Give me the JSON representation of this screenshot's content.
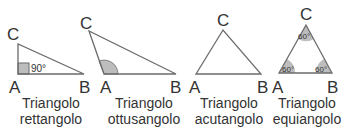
{
  "colors": {
    "stroke": "#6b6b6b",
    "angle_fill": "#bdbdbd",
    "text": "#333333"
  },
  "triangles": [
    {
      "type": "rettangolo",
      "caption_line1": "Triangolo",
      "caption_line2": "rettangolo",
      "vertices": {
        "A": "A",
        "B": "B",
        "C": "C"
      },
      "angle_label": "90°"
    },
    {
      "type": "ottusangolo",
      "caption_line1": "Triangolo",
      "caption_line2": "ottusangolo",
      "vertices": {
        "A": "A",
        "B": "B",
        "C": "C"
      }
    },
    {
      "type": "acutangolo",
      "caption_line1": "Triangolo",
      "caption_line2": "acutangolo",
      "vertices": {
        "A": "A",
        "B": "B",
        "C": "C"
      }
    },
    {
      "type": "equiangolo",
      "caption_line1": "Triangolo",
      "caption_line2": "equiangolo",
      "vertices": {
        "A": "A",
        "B": "B",
        "C": "C"
      },
      "angle_labels": {
        "A": "60°",
        "B": "60°",
        "C": "60°"
      }
    }
  ]
}
